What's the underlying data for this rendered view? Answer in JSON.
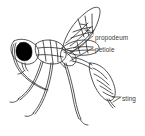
{
  "figure": {
    "background_color": "#ffffff",
    "ink_color": "#2b2b2b",
    "eye_fill_color": "#000000",
    "label_color": "#3a3a3a",
    "width": 145,
    "height": 136
  },
  "labels": [
    {
      "id": "propodeum",
      "text": "propodeum"
    },
    {
      "id": "petiole",
      "text": "petiole"
    },
    {
      "id": "sting",
      "text": "sting"
    }
  ],
  "parts": {
    "head": "head",
    "eye": "compound-eye",
    "antenna": "antenna",
    "thorax": "thorax",
    "forewing": "forewing",
    "hindwing": "hindwing",
    "propodeum": "propodeum",
    "petiole": "petiole",
    "metasoma": "metasoma",
    "sting": "sting",
    "foreleg": "foreleg",
    "midleg": "midleg",
    "hindleg": "hindleg"
  }
}
